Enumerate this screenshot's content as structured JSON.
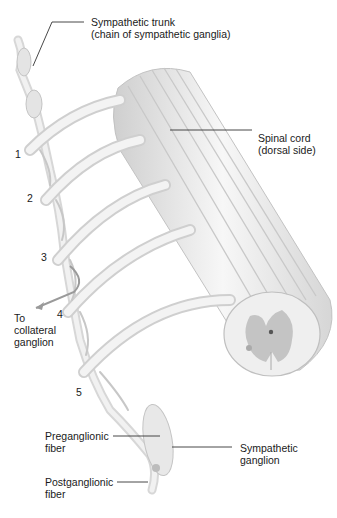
{
  "figure": {
    "type": "anatomical-diagram"
  },
  "labels": {
    "sympathetic_trunk_line1": "Sympathetic trunk",
    "sympathetic_trunk_line2": "(chain of sympathetic ganglia)",
    "spinal_cord_line1": "Spinal cord",
    "spinal_cord_line2": "(dorsal side)",
    "collateral_line1": "To",
    "collateral_line2": "collateral",
    "collateral_line3": "ganglion",
    "preganglionic_line1": "Preganglionic",
    "preganglionic_line2": "fiber",
    "postganglionic_line1": "Postganglionic",
    "postganglionic_line2": "fiber",
    "sympathetic_ganglion_line1": "Sympathetic",
    "sympathetic_ganglion_line2": "ganglion"
  },
  "nerve_numbers": [
    "1",
    "2",
    "3",
    "4",
    "5"
  ],
  "colors": {
    "tissue_light": "#f2f2f2",
    "tissue_mid": "#dcdcdc",
    "tissue_shadow": "#bdbdbd",
    "grey_matter": "#c4c4c4",
    "leader_line": "#333333"
  }
}
